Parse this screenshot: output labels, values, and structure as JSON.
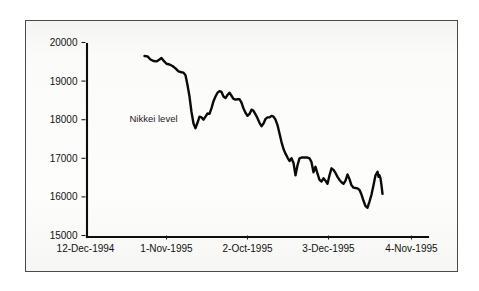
{
  "figure": {
    "background_color": "#ffffff",
    "frame_color": "#4a4a4a",
    "paper_color": "#fbfbfa",
    "line_color": "#0a0a0a"
  },
  "chart_data": {
    "type": "line",
    "title": "",
    "subtitle": "",
    "xlabel": "",
    "ylabel": "",
    "grid": false,
    "legend_position": "inline-annotation",
    "annotations": [
      {
        "text": "Nikkei level",
        "x_px": 130,
        "y_px": 122
      }
    ],
    "ylim": [
      15000,
      20000
    ],
    "ytick_labels": [
      "15000",
      "16000",
      "17000",
      "18000",
      "19000",
      "20000"
    ],
    "yticks": [
      15000,
      16000,
      17000,
      18000,
      19000,
      20000
    ],
    "xtick_labels": [
      "12-Dec-1994",
      "1-Nov-1995",
      "2-Oct-1995",
      "3-Dec-1995",
      "4-Nov-1995"
    ],
    "xtick_positions_px": [
      86,
      167,
      248,
      329,
      412
    ],
    "series": [
      {
        "name": "Nikkei level",
        "color": "#0a0a0a",
        "points": [
          [
            145,
            19650
          ],
          [
            148,
            19640
          ],
          [
            151,
            19560
          ],
          [
            154,
            19520
          ],
          [
            157,
            19510
          ],
          [
            160,
            19560
          ],
          [
            162,
            19600
          ],
          [
            164,
            19530
          ],
          [
            167,
            19450
          ],
          [
            170,
            19430
          ],
          [
            173,
            19390
          ],
          [
            176,
            19330
          ],
          [
            179,
            19250
          ],
          [
            182,
            19230
          ],
          [
            184,
            19220
          ],
          [
            186,
            19150
          ],
          [
            188,
            18900
          ],
          [
            190,
            18600
          ],
          [
            192,
            18200
          ],
          [
            194,
            17900
          ],
          [
            196,
            17780
          ],
          [
            198,
            17920
          ],
          [
            200,
            18080
          ],
          [
            202,
            18060
          ],
          [
            204,
            18000
          ],
          [
            206,
            18080
          ],
          [
            208,
            18160
          ],
          [
            210,
            18150
          ],
          [
            212,
            18300
          ],
          [
            214,
            18480
          ],
          [
            216,
            18600
          ],
          [
            218,
            18700
          ],
          [
            220,
            18740
          ],
          [
            222,
            18720
          ],
          [
            224,
            18600
          ],
          [
            226,
            18560
          ],
          [
            228,
            18640
          ],
          [
            230,
            18700
          ],
          [
            232,
            18620
          ],
          [
            234,
            18540
          ],
          [
            236,
            18520
          ],
          [
            238,
            18530
          ],
          [
            240,
            18530
          ],
          [
            242,
            18440
          ],
          [
            244,
            18290
          ],
          [
            246,
            18180
          ],
          [
            248,
            18100
          ],
          [
            250,
            18150
          ],
          [
            252,
            18260
          ],
          [
            254,
            18230
          ],
          [
            256,
            18140
          ],
          [
            258,
            18040
          ],
          [
            260,
            17920
          ],
          [
            262,
            17830
          ],
          [
            264,
            17900
          ],
          [
            266,
            18020
          ],
          [
            268,
            18060
          ],
          [
            270,
            18060
          ],
          [
            272,
            18100
          ],
          [
            274,
            18080
          ],
          [
            276,
            18000
          ],
          [
            278,
            17860
          ],
          [
            280,
            17640
          ],
          [
            282,
            17420
          ],
          [
            284,
            17240
          ],
          [
            286,
            17120
          ],
          [
            288,
            17020
          ],
          [
            290,
            16930
          ],
          [
            292,
            17000
          ],
          [
            294,
            16880
          ],
          [
            296,
            16560
          ],
          [
            298,
            16820
          ],
          [
            300,
            17000
          ],
          [
            302,
            17020
          ],
          [
            304,
            17020
          ],
          [
            306,
            17020
          ],
          [
            308,
            17020
          ],
          [
            310,
            17000
          ],
          [
            312,
            16900
          ],
          [
            314,
            16640
          ],
          [
            316,
            16780
          ],
          [
            318,
            16600
          ],
          [
            320,
            16440
          ],
          [
            322,
            16400
          ],
          [
            324,
            16480
          ],
          [
            326,
            16420
          ],
          [
            328,
            16340
          ],
          [
            330,
            16560
          ],
          [
            332,
            16740
          ],
          [
            334,
            16700
          ],
          [
            336,
            16620
          ],
          [
            338,
            16520
          ],
          [
            340,
            16440
          ],
          [
            342,
            16380
          ],
          [
            344,
            16340
          ],
          [
            346,
            16420
          ],
          [
            348,
            16580
          ],
          [
            350,
            16460
          ],
          [
            352,
            16300
          ],
          [
            354,
            16240
          ],
          [
            356,
            16230
          ],
          [
            358,
            16220
          ],
          [
            360,
            16180
          ],
          [
            362,
            16060
          ],
          [
            364,
            15900
          ],
          [
            366,
            15760
          ],
          [
            368,
            15720
          ],
          [
            370,
            15880
          ],
          [
            372,
            16060
          ],
          [
            374,
            16300
          ],
          [
            376,
            16560
          ],
          [
            378,
            16650
          ],
          [
            379,
            16520
          ],
          [
            380,
            16560
          ],
          [
            381,
            16480
          ],
          [
            382,
            16300
          ],
          [
            383,
            16080
          ]
        ]
      }
    ]
  }
}
